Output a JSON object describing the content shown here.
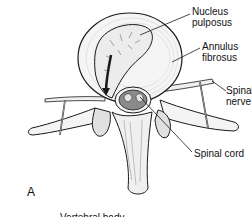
{
  "figure": {
    "panel_letter": "A",
    "labels": [
      {
        "id": "nucleus",
        "text": "Nucleus\npulposus"
      },
      {
        "id": "annulus",
        "text": "Annulus\nfibrosus"
      },
      {
        "id": "nerve",
        "text": "Spinal\nnerve"
      },
      {
        "id": "cord",
        "text": "Spinal cord"
      }
    ],
    "cutoff_caption": "Vertebral body",
    "colors": {
      "line": "#1a1a1a",
      "fill_light": "#f2f2f2",
      "fill_mid": "#d9d9d9",
      "fill_dark": "#8a8a8a",
      "background": "#ffffff"
    }
  }
}
